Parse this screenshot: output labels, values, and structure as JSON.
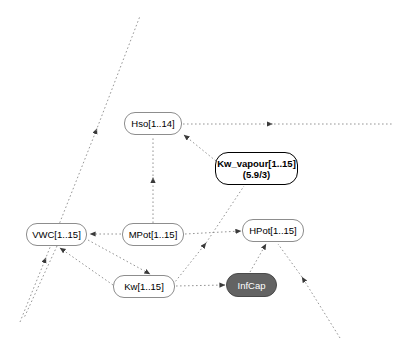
{
  "diagram": {
    "background_color": "#ffffff",
    "edge_color": "#7a7a7a",
    "node_border_color": "#8d8d8d",
    "emphasis_border_color": "#000000",
    "filled_node_color": "#636363",
    "filled_node_text_color": "#ffffff",
    "nodes": [
      {
        "id": "hso",
        "label": "Hso[1..14]",
        "style": "plain",
        "x": 124,
        "y": 112,
        "w": 58,
        "h": 23
      },
      {
        "id": "kw_vapour",
        "label": "Kw_vapour[1..15]\n(5.9/3)",
        "line1": "Kw_vapour[1..15]",
        "line2": "(5.9/3)",
        "style": "emphasis",
        "x": 215,
        "y": 152,
        "w": 83,
        "h": 33
      },
      {
        "id": "vwc",
        "label": "VWC[1..15]",
        "style": "plain",
        "x": 26,
        "y": 223,
        "w": 61,
        "h": 23
      },
      {
        "id": "mpot",
        "label": "MPot[1..15]",
        "style": "plain",
        "x": 122,
        "y": 223,
        "w": 62,
        "h": 23
      },
      {
        "id": "hpot",
        "label": "HPot[1..15]",
        "style": "plain",
        "x": 242,
        "y": 219,
        "w": 62,
        "h": 23
      },
      {
        "id": "kw",
        "label": "Kw[1..15]",
        "style": "plain",
        "x": 113,
        "y": 275,
        "w": 62,
        "h": 23
      },
      {
        "id": "infcap",
        "label": "InfCap",
        "style": "filled",
        "x": 226,
        "y": 273,
        "w": 51,
        "h": 24
      }
    ],
    "edges": [
      {
        "id": "mpot-to-hso",
        "from": "mpot",
        "to": "hso",
        "label": ""
      },
      {
        "id": "kwvapour-to-hso",
        "from": "kw_vapour",
        "to": "hso",
        "label": ""
      },
      {
        "id": "hso-to-right",
        "from": "hso",
        "to": "offscreen-right",
        "label": ""
      },
      {
        "id": "mpot-to-vwc",
        "from": "mpot",
        "to": "vwc",
        "label": ""
      },
      {
        "id": "mpot-to-hpot",
        "from": "mpot",
        "to": "hpot",
        "label": ""
      },
      {
        "id": "kw-to-vwc",
        "from": "kw",
        "to": "vwc",
        "label": ""
      },
      {
        "id": "mpot-to-kw",
        "from": "mpot",
        "to": "kw",
        "label": ""
      },
      {
        "id": "kw-to-infcap",
        "from": "kw",
        "to": "infcap",
        "label": ""
      },
      {
        "id": "infcap-to-hpot",
        "from": "infcap",
        "to": "hpot",
        "label": ""
      },
      {
        "id": "kw-to-kwvapour",
        "from": "kw",
        "to": "kw_vapour",
        "label": ""
      },
      {
        "id": "vwc-to-lowerleft",
        "from": "vwc",
        "to": "offscreen-lower-left",
        "label": ""
      },
      {
        "id": "lowerleft-to-upperright",
        "from": "offscreen-lower-left",
        "to": "offscreen-upper-right",
        "label": ""
      },
      {
        "id": "lowerright-to-hpot",
        "from": "offscreen-lower-right",
        "to": "hpot",
        "label": ""
      }
    ]
  }
}
